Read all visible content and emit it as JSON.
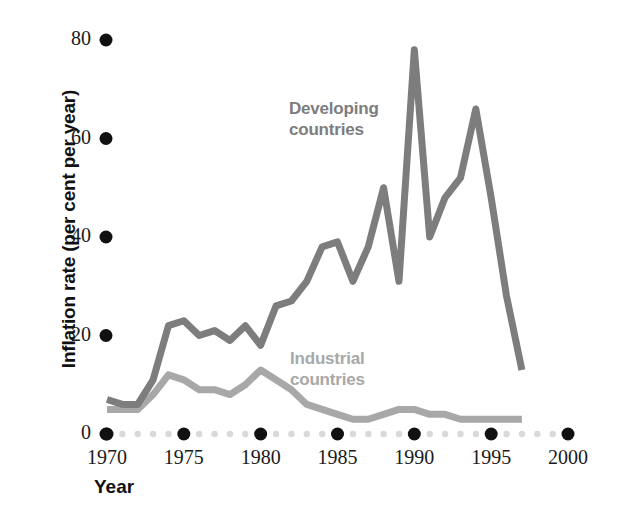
{
  "chart_data": {
    "type": "line",
    "title": "",
    "xlabel": "Year",
    "ylabel": "Inflation rate (per cent per year)",
    "xlim": [
      1970,
      2000
    ],
    "ylim": [
      0,
      80
    ],
    "xticks": [
      "1970",
      "1975",
      "1980",
      "1985",
      "1990",
      "1995",
      "2000"
    ],
    "xtick_values": [
      1970,
      1975,
      1980,
      1985,
      1990,
      1995,
      2000
    ],
    "yticks": [
      "0",
      "20",
      "40",
      "60",
      "80"
    ],
    "ytick_values": [
      0,
      20,
      40,
      60,
      80
    ],
    "grid": false,
    "legend_position": "inline-annotations",
    "series": [
      {
        "name": "Developing countries",
        "color": "#7d7d7d",
        "label_x": 1982.0,
        "label_y": 62,
        "x": [
          1970,
          1971,
          1972,
          1973,
          1974,
          1975,
          1976,
          1977,
          1978,
          1979,
          1980,
          1981,
          1982,
          1983,
          1984,
          1985,
          1986,
          1987,
          1988,
          1989,
          1990,
          1991,
          1992,
          1993,
          1994,
          1995,
          1996,
          1997
        ],
        "values": [
          7,
          6,
          6,
          11,
          22,
          23,
          20,
          21,
          19,
          22,
          18,
          26,
          27,
          31,
          38,
          39,
          31,
          38,
          50,
          31,
          78,
          40,
          48,
          52,
          66,
          48,
          28,
          13
        ]
      },
      {
        "name": "Industrial countries",
        "color": "#a8a8a8",
        "label_x": 1982.2,
        "label_y": 17,
        "x": [
          1970,
          1971,
          1972,
          1973,
          1974,
          1975,
          1976,
          1977,
          1978,
          1979,
          1980,
          1981,
          1982,
          1983,
          1984,
          1985,
          1986,
          1987,
          1988,
          1989,
          1990,
          1991,
          1992,
          1993,
          1994,
          1995,
          1996,
          1997
        ],
        "values": [
          5,
          5,
          5,
          8,
          12,
          11,
          9,
          9,
          8,
          10,
          13,
          11,
          9,
          6,
          5,
          4,
          3,
          3,
          4,
          5,
          5,
          4,
          4,
          3,
          3,
          3,
          3,
          3
        ]
      }
    ]
  },
  "axes": {
    "y_axis_label": "Inflation rate (per cent per year)",
    "x_axis_label": "Year"
  },
  "annotations": {
    "developing": {
      "line1": "Developing",
      "line2": "countries",
      "color": "#7d7d7d"
    },
    "industrial": {
      "line1": "Industrial",
      "line2": "countries",
      "color": "#a8a8a8"
    }
  },
  "ticks": {
    "y": [
      "80",
      "60",
      "40",
      "20",
      "0"
    ],
    "x": [
      "1970",
      "1975",
      "1980",
      "1985",
      "1990",
      "1995",
      "2000"
    ]
  },
  "colors": {
    "developing": "#7d7d7d",
    "industrial": "#a8a8a8",
    "tick_dot": "#111111",
    "minor_dot": "#d9d9d9",
    "text": "#1a1a1a",
    "background": "#ffffff"
  }
}
